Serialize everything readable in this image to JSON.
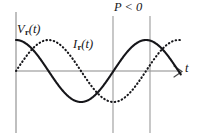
{
  "figure": {
    "title": "",
    "background_color": "#ffffff",
    "labels": {
      "voltage": {
        "symbol": "V",
        "subscript": "r",
        "argument": "(t)",
        "full": "V r (t)"
      },
      "current": {
        "symbol": "I",
        "subscript": "r",
        "argument": "(t)",
        "full": "I r (t)"
      },
      "power_region": "P < 0",
      "time_axis": "t"
    },
    "colors": {
      "curve": "#16161a",
      "axis": "#8a8a8a",
      "marker": "#9a9a9a"
    }
  },
  "chart_data": {
    "type": "line",
    "title": "",
    "xlabel": "t",
    "ylabel": "",
    "grid": false,
    "legend": "inline-annotations",
    "xlim": [
      0,
      2.05
    ],
    "ylim": [
      -1.25,
      1.25
    ],
    "x_unit": "periods",
    "annotations": [
      {
        "text": "V r (t)",
        "x": 0.02,
        "y": 1.05,
        "style": "italic",
        "target_series": "V_r(t)"
      },
      {
        "text": "I r (t)",
        "x": 0.45,
        "y": 0.72,
        "style": "italic",
        "target_series": "I_r(t)"
      },
      {
        "text": "P < 0",
        "x": 0.78,
        "y": 1.2,
        "style": "italic",
        "description": "label above region between the two vertical marker lines"
      },
      {
        "text": "t",
        "x": 2.0,
        "y": 0.08,
        "style": "italic",
        "description": "time axis label at arrow tip"
      }
    ],
    "vertical_markers": [
      {
        "x": 0.75,
        "color": "#9a9a9a",
        "label": ""
      },
      {
        "x": 1.03,
        "color": "#9a9a9a",
        "label": ""
      }
    ],
    "series": [
      {
        "name": "V_r(t)",
        "style": "solid",
        "color": "#16161a",
        "amplitude": 1.0,
        "phase_deg": 0,
        "form": "cos",
        "x": [
          0.0,
          0.1,
          0.2,
          0.25,
          0.3,
          0.4,
          0.5,
          0.6,
          0.7,
          0.75,
          0.8,
          0.9,
          1.0,
          1.1,
          1.2,
          1.25,
          1.3
        ],
        "values": [
          1.0,
          0.81,
          0.31,
          0.0,
          -0.31,
          -0.81,
          -1.0,
          -0.81,
          -0.31,
          0.0,
          0.31,
          0.81,
          1.0,
          0.81,
          0.31,
          0.0,
          -0.31
        ]
      },
      {
        "name": "I_r(t)",
        "style": "dotted",
        "color": "#18181c",
        "amplitude": 1.0,
        "phase_deg": -90,
        "form": "cos",
        "x": [
          0.0,
          0.1,
          0.2,
          0.25,
          0.3,
          0.4,
          0.5,
          0.6,
          0.7,
          0.75,
          0.8,
          0.9,
          1.0,
          1.1,
          1.2,
          1.25,
          1.3
        ],
        "values": [
          0.0,
          0.59,
          0.95,
          1.0,
          0.95,
          0.59,
          0.0,
          -0.59,
          -0.95,
          -1.0,
          -0.95,
          -0.59,
          0.0,
          0.59,
          0.95,
          1.0,
          0.95
        ]
      }
    ]
  },
  "geometry": {
    "baseline_y": 71,
    "origin_x": 16,
    "axis_right_x": 181,
    "amplitude_px": 31,
    "period_px": 130,
    "phase_lag_px": 32.5,
    "marker_x": [
      113,
      150
    ],
    "top_y": 12,
    "bottom_y": 133
  }
}
